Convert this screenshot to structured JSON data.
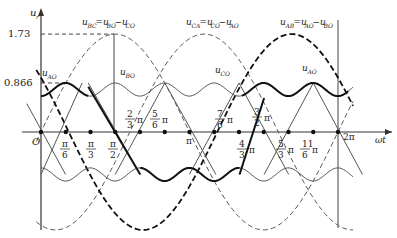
{
  "axes": {
    "y_label": "u",
    "y_label_sub": "r",
    "x_label": "ωt",
    "origin_label": "O",
    "y_ticks": [
      {
        "value": 1.73,
        "label": "1.73"
      },
      {
        "value": 0.866,
        "label": "0.866"
      }
    ]
  },
  "x_ticks": [
    {
      "id": "pi6",
      "num": "π",
      "den": "6",
      "x": 0.5236
    },
    {
      "id": "pi3",
      "num": "π",
      "den": "3",
      "x": 1.0472
    },
    {
      "id": "pi2",
      "num": "π",
      "den": "2",
      "x": 1.5708
    },
    {
      "id": "2pi3",
      "label": "2/3 π",
      "num": "2",
      "den": "3",
      "x": 2.0944
    },
    {
      "id": "5pi6",
      "label": "5/6 π",
      "num": "5",
      "den": "6",
      "x": 2.618
    },
    {
      "id": "pi",
      "label": "π",
      "x": 3.1416
    },
    {
      "id": "7pi6",
      "label": "7/6 π",
      "num": "7",
      "den": "6",
      "x": 3.6652
    },
    {
      "id": "4pi3",
      "label": "4/3 π",
      "num": "4",
      "den": "3",
      "x": 4.1888
    },
    {
      "id": "3pi2",
      "label": "3/2 π",
      "num": "3",
      "den": "2",
      "x": 4.7124
    },
    {
      "id": "5pi3",
      "label": "5/3 π",
      "num": "5",
      "den": "3",
      "x": 5.236
    },
    {
      "id": "11pi6",
      "label": "11/6 π",
      "num": "11",
      "den": "6",
      "x": 5.7596
    },
    {
      "id": "2pi",
      "label": "2π",
      "x": 6.2832
    }
  ],
  "curve_labels": {
    "u_bc": {
      "main": "u",
      "sub1": "BC",
      "eq": "=u",
      "sub2": "BO",
      "eq2": "−u",
      "sub3": "CO"
    },
    "u_ca": {
      "main": "u",
      "sub1": "CA",
      "eq": "=u",
      "sub2": "CO",
      "eq2": "−u",
      "sub3": "AO"
    },
    "u_ab": {
      "main": "u",
      "sub1": "AB",
      "eq": "=u",
      "sub2": "AO",
      "eq2": "−u",
      "sub3": "BO"
    },
    "u_ao": {
      "main": "u",
      "sub": "AO"
    },
    "u_bo": {
      "main": "u",
      "sub": "BO"
    },
    "u_co": {
      "main": "u",
      "sub": "CO"
    },
    "u_ao2": {
      "main": "u",
      "sub": "AO"
    }
  },
  "chart_data": {
    "type": "line",
    "title": "",
    "xlabel": "ωt",
    "ylabel": "u_r",
    "series": [
      {
        "name": "u_AB = u_AO − u_BO",
        "style": "thick dashed",
        "amplitude": 1.73
      },
      {
        "name": "u_BC = u_BO − u_CO",
        "style": "thin dashed",
        "amplitude": 1.73
      },
      {
        "name": "u_CA = u_CO − u_AO",
        "style": "thin dashed",
        "amplitude": 1.73
      },
      {
        "name": "u_AO",
        "style": "thick solid segments",
        "amplitude": 0.866
      },
      {
        "name": "u_BO",
        "style": "thin solid",
        "amplitude": 0.866
      },
      {
        "name": "u_CO",
        "style": "thin solid",
        "amplitude": 0.866
      }
    ],
    "x_range": [
      0,
      6.2832
    ],
    "y_ticks": [
      1.73,
      0.866
    ]
  }
}
